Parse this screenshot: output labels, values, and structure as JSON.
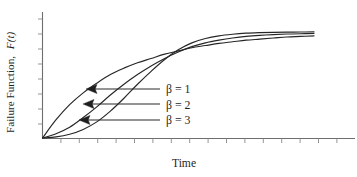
{
  "figure": {
    "axis_label_y_main": "Failure Function,",
    "axis_label_y_symbol": "F(t)",
    "axis_label_x": "Time"
  },
  "legend": {
    "items": [
      {
        "label": "β = 1"
      },
      {
        "label": "β = 2"
      },
      {
        "label": "β = 3"
      }
    ]
  },
  "chart_data": {
    "type": "line",
    "title": "",
    "subtitle": "",
    "xlabel": "Time",
    "ylabel": "Failure Function, F(t)",
    "grid": false,
    "legend_position": "inside-right-middle",
    "axis_style": "open-L-with-outward-ticks",
    "xlim": [
      0,
      1
    ],
    "ylim": [
      0,
      1
    ],
    "x_tick_count": 17,
    "y_tick_count": 9,
    "x_tick_labels": [],
    "y_tick_labels": [],
    "annotations": [
      {
        "text": "β = 1",
        "points_to_series": "beta = 1",
        "arrow": "left"
      },
      {
        "text": "β = 2",
        "points_to_series": "beta = 2",
        "arrow": "left"
      },
      {
        "text": "β = 3",
        "points_to_series": "beta = 3",
        "arrow": "left"
      }
    ],
    "x": [
      0,
      0.05,
      0.1,
      0.15,
      0.2,
      0.25,
      0.3,
      0.35,
      0.4,
      0.45,
      0.5,
      0.55,
      0.6,
      0.65,
      0.7,
      0.75,
      0.8,
      0.85,
      0.9,
      0.95,
      1.0
    ],
    "series": [
      {
        "name": "beta = 1",
        "label": "β = 1",
        "values": [
          0,
          0.17,
          0.31,
          0.42,
          0.51,
          0.59,
          0.65,
          0.7,
          0.74,
          0.78,
          0.81,
          0.84,
          0.86,
          0.88,
          0.895,
          0.91,
          0.92,
          0.93,
          0.94,
          0.945,
          0.95
        ]
      },
      {
        "name": "beta = 2",
        "label": "β = 2",
        "values": [
          0,
          0.04,
          0.1,
          0.19,
          0.29,
          0.4,
          0.5,
          0.59,
          0.67,
          0.74,
          0.8,
          0.85,
          0.885,
          0.91,
          0.93,
          0.945,
          0.955,
          0.962,
          0.967,
          0.97,
          0.972
        ]
      },
      {
        "name": "beta = 3",
        "label": "β = 3",
        "values": [
          0,
          0.01,
          0.035,
          0.08,
          0.15,
          0.25,
          0.37,
          0.5,
          0.62,
          0.73,
          0.82,
          0.885,
          0.925,
          0.95,
          0.965,
          0.975,
          0.98,
          0.983,
          0.985,
          0.986,
          0.987
        ]
      }
    ]
  }
}
